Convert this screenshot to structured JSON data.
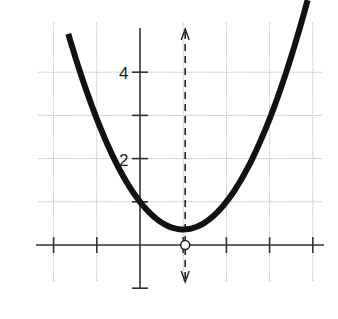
{
  "chart_data": {
    "type": "line",
    "title": "",
    "xlabel": "",
    "ylabel": "",
    "xlim": [
      -2,
      4
    ],
    "ylim": [
      -1,
      5
    ],
    "grid": true,
    "y_tick_labels": [
      {
        "value": 4,
        "label": "4"
      },
      {
        "value": 2,
        "label": "2"
      }
    ],
    "x_ticks": [
      -2,
      -1,
      1,
      2,
      3,
      4
    ],
    "y_ticks": [
      -1,
      1,
      2,
      3,
      4
    ],
    "series": [
      {
        "name": "parabola",
        "equation": "y = 0.64(x - 1)^2 + 0.36",
        "vertex": [
          1,
          0.36
        ],
        "y_intercept": [
          0,
          1
        ],
        "x_range": [
          -1.66,
          3.88
        ],
        "color": "#111111"
      }
    ],
    "annotations": [
      {
        "type": "axis_of_symmetry",
        "style": "dashed",
        "x": 1,
        "arrows": "both"
      },
      {
        "type": "open_point",
        "x": 1,
        "y": 0
      }
    ]
  },
  "labels": {
    "y4": "4",
    "y2": "2"
  },
  "colors": {
    "curve": "#111111",
    "axis": "#333333",
    "grid": "#bdbdbd"
  }
}
